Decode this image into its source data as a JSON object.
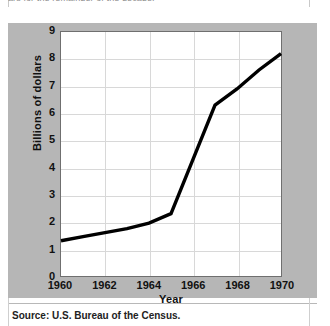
{
  "figure": {
    "top_clipped_caption": "ars for the remainder of the decade.",
    "source_note": "Source: U.S. Bureau of the Census.",
    "panel_color": "#b6b6b6",
    "plot_background": "#ffffff",
    "line_color": "#000000",
    "grid_color": "#d8d8d8",
    "frame_color": "#6f6f6f"
  },
  "chart_data": {
    "type": "line",
    "title": "",
    "xlabel": "Year",
    "ylabel": "Billions of dollars",
    "xlim": [
      1960,
      1970
    ],
    "ylim": [
      0,
      9
    ],
    "grid": true,
    "legend": false,
    "xticks": [
      "1960",
      "1962",
      "1964",
      "1966",
      "1968",
      "1970"
    ],
    "yticks": [
      "0",
      "1",
      "2",
      "3",
      "4",
      "5",
      "6",
      "7",
      "8",
      "9"
    ],
    "x": [
      1960,
      1961,
      1962,
      1963,
      1964,
      1965,
      1966,
      1967,
      1968,
      1969,
      1970
    ],
    "values": [
      1.3,
      1.45,
      1.6,
      1.75,
      1.95,
      2.3,
      4.3,
      6.3,
      6.9,
      7.6,
      8.2
    ],
    "series": [
      {
        "name": "Billions of dollars",
        "values": [
          1.3,
          1.45,
          1.6,
          1.75,
          1.95,
          2.3,
          4.3,
          6.3,
          6.9,
          7.6,
          8.2
        ]
      }
    ]
  }
}
